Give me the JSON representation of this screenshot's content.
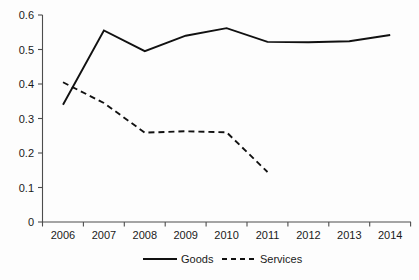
{
  "chart_data": {
    "type": "line",
    "title": "",
    "xlabel": "",
    "ylabel": "",
    "categories": [
      "2006",
      "2007",
      "2008",
      "2009",
      "2010",
      "2011",
      "2012",
      "2013",
      "2014"
    ],
    "ylim": [
      0,
      0.6
    ],
    "ytick_labels": [
      "0",
      "0.1",
      "0.2",
      "0.3",
      "0.4",
      "0.5",
      "0.6"
    ],
    "ytick_values": [
      0,
      0.1,
      0.2,
      0.3,
      0.4,
      0.5,
      0.6
    ],
    "grid": false,
    "legend_position": "bottom-center",
    "series": [
      {
        "name": "Goods",
        "style": "solid",
        "color": "#111111",
        "values": [
          0.34,
          0.555,
          0.495,
          0.54,
          0.562,
          0.522,
          0.521,
          0.524,
          0.542
        ]
      },
      {
        "name": "Services",
        "style": "dashed",
        "color": "#111111",
        "values": [
          0.405,
          0.345,
          0.259,
          0.263,
          0.26,
          0.145,
          null,
          null,
          null
        ]
      }
    ],
    "legend": [
      {
        "label": "Goods",
        "style": "solid"
      },
      {
        "label": "Services",
        "style": "dashed"
      }
    ]
  }
}
